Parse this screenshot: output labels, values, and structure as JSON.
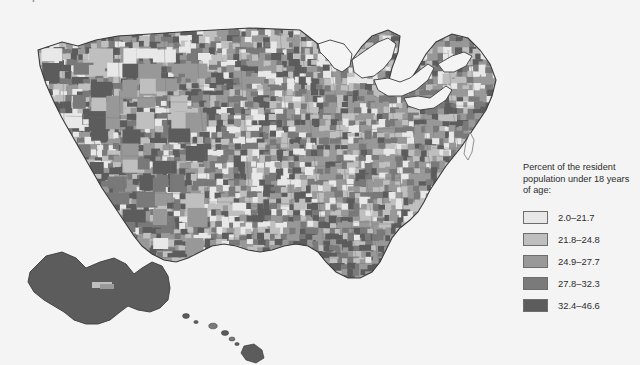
{
  "figure": {
    "title": "Map 1.1  Children in the United States",
    "background_color": "#f4f4f4"
  },
  "legend": {
    "title": "Percent of the resident population under 18 years of age:",
    "items": [
      {
        "label": "2.0–21.7",
        "color": "#e8e8e8"
      },
      {
        "label": "21.8–24.8",
        "color": "#bfbfbf"
      },
      {
        "label": "24.9–27.7",
        "color": "#999999"
      },
      {
        "label": "27.8–32.3",
        "color": "#7a7a7a"
      },
      {
        "label": "32.4–46.6",
        "color": "#5c5c5c"
      }
    ]
  },
  "map": {
    "name": "united-states-counties-choropleth",
    "projection": "albers-usa",
    "insets": [
      "alaska",
      "hawaii"
    ],
    "outline_color": "#3c3c3c",
    "water_color": "#f4f4f4"
  },
  "chart_data": {
    "type": "heatmap",
    "title": "Map 1.1  Children in the United States",
    "subtitle": "Percent of the resident population under 18 years of age:",
    "legend_position": "right",
    "categories": [
      "2.0–21.7",
      "21.8–24.8",
      "24.9–27.7",
      "27.8–32.3",
      "32.4–46.6"
    ],
    "colors": [
      "#e8e8e8",
      "#bfbfbf",
      "#999999",
      "#7a7a7a",
      "#5c5c5c"
    ],
    "value_range": [
      2.0,
      46.6
    ],
    "unit": "percent",
    "geography": "US counties",
    "notes": [
      "Florida peninsula shows predominantly the two lightest classes.",
      "Texas Gulf Coast, the Southwest, the Southeast and Alaska show the darkest classes.",
      "Great Plains counties are highly mixed across all five classes."
    ]
  }
}
